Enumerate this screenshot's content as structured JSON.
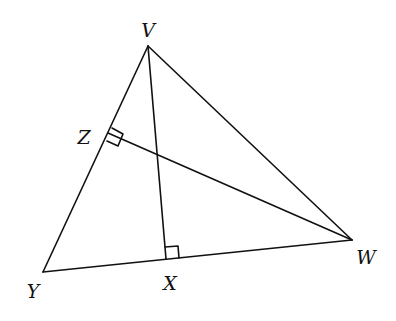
{
  "diagram": {
    "type": "triangle-with-altitudes",
    "stroke_color": "#111111",
    "points": {
      "V": {
        "x": 148,
        "y": 46,
        "label": "V",
        "label_x": 148,
        "label_y": 30
      },
      "Y": {
        "x": 43,
        "y": 272,
        "label": "Y",
        "label_x": 33,
        "label_y": 291
      },
      "W": {
        "x": 352,
        "y": 240,
        "label": "W",
        "label_x": 366,
        "label_y": 257
      },
      "X": {
        "x": 166,
        "y": 259,
        "label": "X",
        "label_x": 170,
        "label_y": 283
      },
      "Z": {
        "x": 108,
        "y": 133,
        "label": "Z",
        "label_x": 84,
        "label_y": 137
      }
    },
    "segments": [
      {
        "from": "V",
        "to": "Y",
        "name": "side-VY"
      },
      {
        "from": "Y",
        "to": "W",
        "name": "side-YW"
      },
      {
        "from": "W",
        "to": "V",
        "name": "side-WV"
      },
      {
        "from": "V",
        "to": "X",
        "name": "altitude-VX"
      },
      {
        "from": "W",
        "to": "Z",
        "name": "altitude-WZ"
      }
    ],
    "right_angles": [
      {
        "at": "X",
        "name": "right-angle-X"
      },
      {
        "at": "Z",
        "name": "right-angle-Z"
      }
    ]
  }
}
